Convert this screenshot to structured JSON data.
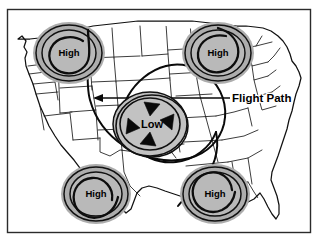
{
  "figure": {
    "kind": "weather-map-diagram",
    "region": "Continental United States",
    "frame": {
      "border_color": "#2b2b2b",
      "background": "#ffffff"
    }
  },
  "colors": {
    "pressure_disc_outer": "#adadad",
    "pressure_disc_inner": "#b9b9b9",
    "low_disc": "#c2c2c2",
    "line": "#111111",
    "text": "#000000",
    "map_fill": "#ffffff"
  },
  "pressure_systems": [
    {
      "id": "high-northwest",
      "type": "high",
      "label": "High",
      "position": {
        "x": 69,
        "y": 53
      },
      "radius_x": 36,
      "radius_y": 31
    },
    {
      "id": "high-northeast",
      "type": "high",
      "label": "High",
      "position": {
        "x": 218,
        "y": 53
      },
      "radius_x": 36,
      "radius_y": 31
    },
    {
      "id": "low-center",
      "type": "low",
      "label": "Low",
      "position": {
        "x": 150,
        "y": 124
      },
      "radius_x": 37,
      "radius_y": 32
    },
    {
      "id": "high-southwest",
      "type": "high",
      "label": "High",
      "position": {
        "x": 96,
        "y": 194
      },
      "radius_x": 35,
      "radius_y": 30
    },
    {
      "id": "high-southeast",
      "type": "high",
      "label": "High",
      "position": {
        "x": 215,
        "y": 194
      },
      "radius_x": 35,
      "radius_y": 30
    }
  ],
  "flight_path": {
    "label": "Flight Path",
    "label_position": {
      "x": 232,
      "y": 98
    },
    "direction": "east-to-west (arrowheads point west)",
    "arrowheads": 2
  },
  "low_circulation": {
    "rotation": "counterclockwise",
    "arrow_count": 4
  }
}
